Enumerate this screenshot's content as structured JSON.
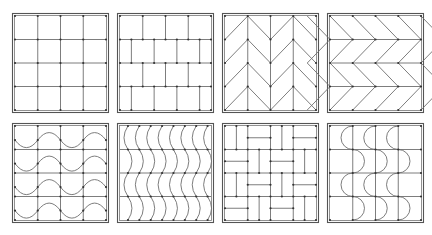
{
  "figure": {
    "title": "Tile pattern layouts",
    "colors": {
      "line": "#6e6e6e",
      "frame": "#555555",
      "dot": "#333333",
      "background": "#ffffff"
    },
    "frame_size": {
      "w": 97,
      "h": 100
    },
    "tiles": [
      {
        "id": "square-grid",
        "label": "Square grid",
        "x": 12,
        "y": 13
      },
      {
        "id": "running-bond",
        "label": "Running bond (brick)",
        "x": 117,
        "y": 13
      },
      {
        "id": "vertical-herringbone",
        "label": "Vertical herringbone/chevron",
        "x": 222,
        "y": 13
      },
      {
        "id": "horizontal-herringbone",
        "label": "Horizontal herringbone/chevron",
        "x": 327,
        "y": 13
      },
      {
        "id": "horizontal-wave",
        "label": "Horizontal wave",
        "x": 12,
        "y": 123
      },
      {
        "id": "vertical-wave",
        "label": "Vertical wave",
        "x": 117,
        "y": 123
      },
      {
        "id": "basketweave",
        "label": "Basketweave",
        "x": 222,
        "y": 123
      },
      {
        "id": "semicircle-wave",
        "label": "Semicircle (fish-scale) wave",
        "x": 327,
        "y": 123
      }
    ]
  }
}
